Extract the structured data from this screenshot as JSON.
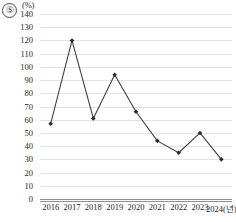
{
  "item_number": "⑤",
  "chart_data": {
    "type": "line",
    "title": "",
    "subtitle": "",
    "xlabel": "2024(년)",
    "ylabel": "(%)",
    "y_unit": "(%)",
    "categories": [
      "2016",
      "2017",
      "2018",
      "2019",
      "2020",
      "2021",
      "2022",
      "2023",
      "2024"
    ],
    "x_tick_labels": [
      "2016",
      "2017",
      "2018",
      "2019",
      "2020",
      "2021",
      "2022",
      "2023",
      "2024(년)"
    ],
    "values": [
      57,
      120,
      61,
      94,
      66,
      44,
      35,
      50,
      30
    ],
    "series": [
      {
        "name": "",
        "values": [
          57,
          120,
          61,
          94,
          66,
          44,
          35,
          50,
          30
        ]
      }
    ],
    "ylim": [
      0,
      140
    ],
    "y_ticks": [
      0,
      10,
      20,
      30,
      40,
      50,
      60,
      70,
      80,
      90,
      100,
      110,
      120,
      130,
      140
    ],
    "y_tick_labels": [
      "0",
      "10",
      "20",
      "30",
      "40",
      "50",
      "60",
      "70",
      "80",
      "90",
      "100",
      "110",
      "120",
      "130",
      "140"
    ],
    "grid": true,
    "grid_axis": "y",
    "legend": false,
    "legend_position": "none",
    "marker": "diamond",
    "line_color": "#3f3f3f",
    "marker_color": "#2a2a2a",
    "grid_color": "#e3e3e3",
    "axis_color": "#8f8f8f"
  }
}
